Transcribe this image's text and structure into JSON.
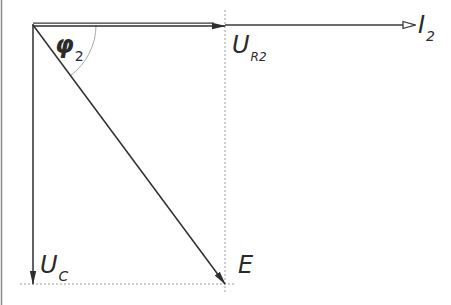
{
  "diagram": {
    "type": "phasor-diagram",
    "colors": {
      "line": "#3a3a3a",
      "dotted": "#9a9a9a",
      "arc": "#a8a8a8",
      "border": "#8a8a8a",
      "background": "#ffffff"
    },
    "vectors": [
      {
        "id": "U_R2",
        "label_main": "U",
        "label_sub": "R2",
        "from": [
          33,
          25
        ],
        "to": [
          225,
          25
        ],
        "head": "filled",
        "style": "double"
      },
      {
        "id": "I_2",
        "label_main": "I",
        "label_sub": "2",
        "from": [
          225,
          25
        ],
        "to": [
          415,
          25
        ],
        "head": "open",
        "style": "thin"
      },
      {
        "id": "U_C",
        "label_main": "U",
        "label_sub": "C",
        "from": [
          33,
          25
        ],
        "to": [
          33,
          283
        ],
        "head": "filled",
        "style": "single"
      },
      {
        "id": "E",
        "label_main": "E",
        "label_sub": "",
        "from": [
          33,
          25
        ],
        "to": [
          225,
          283
        ],
        "head": "filled",
        "style": "single"
      }
    ],
    "angle": {
      "label_main": "φ",
      "label_sub": "2",
      "center": [
        33,
        25
      ],
      "radius": 63
    }
  },
  "labels": {
    "phi": {
      "main": "φ",
      "sub": "2"
    },
    "ur2": {
      "main": "U",
      "sub": "R2"
    },
    "i2": {
      "main": "I",
      "sub": "2"
    },
    "uc": {
      "main": "U",
      "sub": "C"
    },
    "e": {
      "main": "E"
    }
  }
}
